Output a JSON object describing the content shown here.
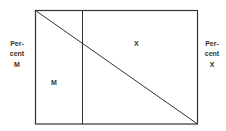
{
  "diagram": {
    "left_axis": {
      "line1": "Per-",
      "line2": "cent",
      "line3": "M"
    },
    "right_axis": {
      "line1": "Per-",
      "line2": "cent",
      "line3": "X"
    },
    "regions": {
      "lower_left_label": "M",
      "upper_right_label": "X"
    },
    "colors": {
      "line": "#333333",
      "background": "#ffffff"
    }
  }
}
